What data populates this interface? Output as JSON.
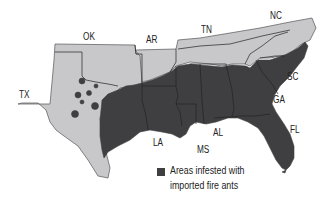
{
  "map": {
    "colors": {
      "infested": "#3f3f41",
      "not_infested": "#c8c8ca",
      "border": "#555557",
      "background": "#ffffff"
    },
    "states": [
      {
        "abbr": "TX",
        "x": 19,
        "y": 89
      },
      {
        "abbr": "OK",
        "x": 83,
        "y": 31
      },
      {
        "abbr": "AR",
        "x": 146,
        "y": 34
      },
      {
        "abbr": "TN",
        "x": 201,
        "y": 24
      },
      {
        "abbr": "NC",
        "x": 270,
        "y": 10
      },
      {
        "abbr": "SC",
        "x": 287,
        "y": 71
      },
      {
        "abbr": "GA",
        "x": 273,
        "y": 94
      },
      {
        "abbr": "FL",
        "x": 290,
        "y": 124
      },
      {
        "abbr": "AL",
        "x": 213,
        "y": 127
      },
      {
        "abbr": "LA",
        "x": 153,
        "y": 137
      },
      {
        "abbr": "MS",
        "x": 197,
        "y": 144
      }
    ]
  },
  "legend": {
    "line1": "Areas infested with",
    "line2": "imported fire ants"
  }
}
